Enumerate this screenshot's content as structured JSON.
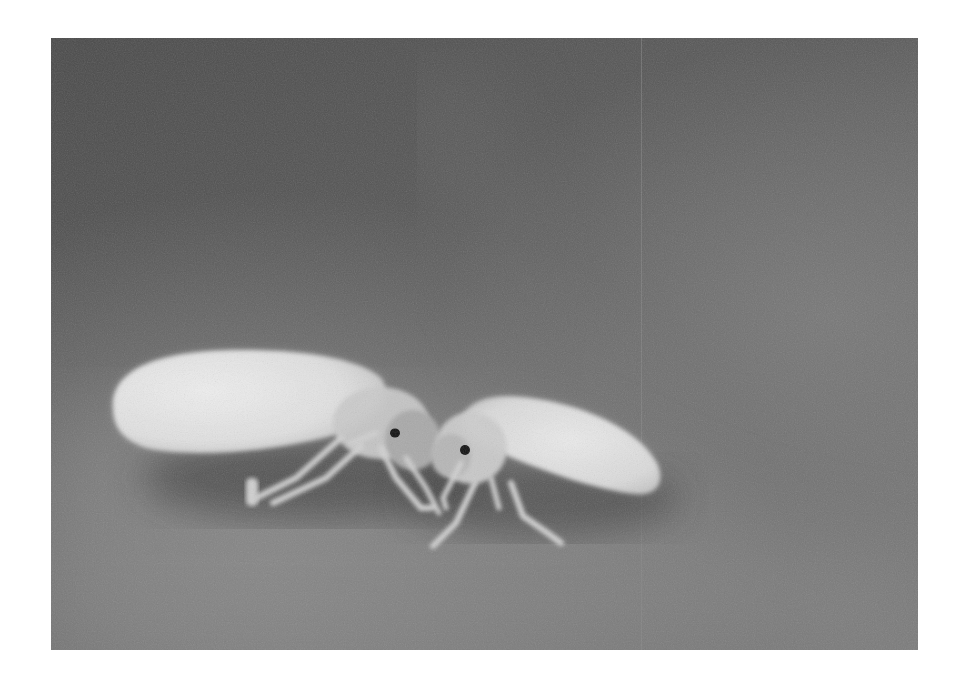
{
  "image": {
    "kind": "photograph",
    "description": "Grayscale macro photograph of two whiteflies facing each other on a leaf surface",
    "color_mode": "grayscale",
    "page_background": "#ffffff",
    "frame": {
      "left": 51,
      "top": 38,
      "width": 867,
      "height": 612
    },
    "subjects": [
      {
        "name": "whitefly-left",
        "facing": "right",
        "wing_tone": "#e4e4e4"
      },
      {
        "name": "whitefly-right",
        "facing": "left",
        "wing_tone": "#e2e2e2"
      }
    ],
    "tones": {
      "background_dark": "#4e4e4e",
      "background_mid": "#6a6a6a",
      "background_light": "#8a8a8a",
      "shadow": "#3a3a3a",
      "wing": "#e6e6e6",
      "body": "#c8c8c8",
      "leg": "#d4d4d4",
      "eye": "#111111"
    }
  },
  "caption": "Two whiteflies"
}
